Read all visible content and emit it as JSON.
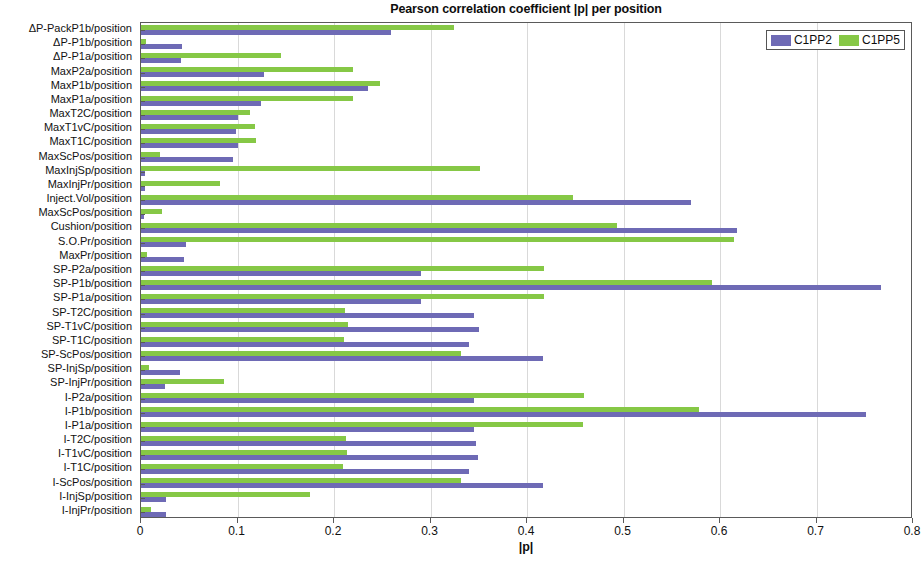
{
  "chart_data": {
    "type": "bar",
    "orientation": "horizontal",
    "title": "Pearson correlation coefficient |p| per position",
    "xlabel": "|p|",
    "ylabel": "",
    "xlim": [
      0,
      0.8
    ],
    "xticks": [
      0,
      0.1,
      0.2,
      0.3,
      0.4,
      0.5,
      0.6,
      0.7,
      0.8
    ],
    "xtick_labels": [
      "0",
      "0.1",
      "0.2",
      "0.3",
      "0.4",
      "0.5",
      "0.6",
      "0.7",
      "0.8"
    ],
    "grid": true,
    "legend_position": "top-right",
    "colors": {
      "C1PP2": "#6e6ab5",
      "C1PP5": "#86c846"
    },
    "categories": [
      "ΔP-PackP1b/position",
      "ΔP-P1b/position",
      "ΔP-P1a/position",
      "MaxP2a/position",
      "MaxP1b/position",
      "MaxP1a/position",
      "MaxT2C/position",
      "MaxT1vC/position",
      "MaxT1C/position",
      "MaxScPos/position",
      "MaxInjSp/position",
      "MaxInjPr/position",
      "Inject.Vol/position",
      "MaxScPos/position",
      "Cushion/position",
      "S.O.Pr/position",
      "MaxPr/position",
      "SP-P2a/position",
      "SP-P1b/position",
      "SP-P1a/position",
      "SP-T2C/position",
      "SP-T1vC/position",
      "SP-T1C/position",
      "SP-ScPos/position",
      "SP-InjSp/position",
      "SP-InjPr/position",
      "I-P2a/position",
      "I-P1b/position",
      "I-P1a/position",
      "I-T2C/position",
      "I-T1vC/position",
      "I-T1C/position",
      "I-ScPos/position",
      "I-InjSp/position",
      "I-InjPr/position"
    ],
    "series": [
      {
        "name": "C1PP2",
        "color": "#6e6ab5",
        "values": [
          0.259,
          0.043,
          0.041,
          0.127,
          0.235,
          0.124,
          0.1,
          0.098,
          0.101,
          0.095,
          0.004,
          0.004,
          0.57,
          0.003,
          0.618,
          0.047,
          0.045,
          0.29,
          0.767,
          0.29,
          0.345,
          0.35,
          0.34,
          0.417,
          0.04,
          0.025,
          0.345,
          0.751,
          0.345,
          0.347,
          0.349,
          0.34,
          0.417,
          0.026,
          0.026
        ]
      },
      {
        "name": "C1PP5",
        "color": "#86c846",
        "values": [
          0.324,
          0.005,
          0.145,
          0.22,
          0.248,
          0.22,
          0.113,
          0.118,
          0.119,
          0.02,
          0.351,
          0.082,
          0.448,
          0.022,
          0.493,
          0.615,
          0.006,
          0.418,
          0.592,
          0.418,
          0.211,
          0.214,
          0.21,
          0.332,
          0.008,
          0.086,
          0.459,
          0.578,
          0.458,
          0.212,
          0.213,
          0.209,
          0.332,
          0.175,
          0.01
        ]
      }
    ]
  },
  "legend": {
    "entries": [
      {
        "label": "C1PP2"
      },
      {
        "label": "C1PP5"
      }
    ]
  }
}
